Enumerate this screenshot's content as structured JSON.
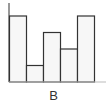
{
  "chart_data": {
    "type": "bar",
    "title": "",
    "xlabel": "B",
    "ylabel": "",
    "categories": [
      "",
      "",
      "",
      "",
      ""
    ],
    "values": [
      4,
      1,
      3,
      2,
      4
    ],
    "ylim": [
      0,
      4.4
    ],
    "grid": false,
    "legend": null,
    "bar_fill": "#f7f7f7",
    "bar_stroke": "#333333"
  },
  "layout": {
    "plot_left": 9,
    "plot_bottom": 82,
    "plot_top": 3,
    "axis_right": 106,
    "bar_width": 17,
    "unit_px": 16.5
  }
}
